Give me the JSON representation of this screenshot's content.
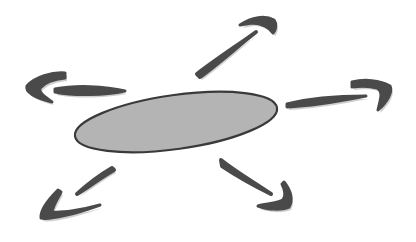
{
  "diagram": {
    "type": "hub-and-spoke",
    "colors": {
      "background": "#ffffff",
      "center_fill": "#b4b4b4",
      "center_stroke": "#3a3a3a",
      "arrow_fill": "#4a4a4a",
      "arrow_shadow": "#cfcfcf"
    },
    "center": {
      "shape": "ellipse",
      "label": ""
    },
    "arrows": [
      {
        "id": "up-right",
        "direction": "north-east"
      },
      {
        "id": "left",
        "direction": "west"
      },
      {
        "id": "right",
        "direction": "east"
      },
      {
        "id": "down-left",
        "direction": "south-west"
      },
      {
        "id": "down-right",
        "direction": "south-east"
      }
    ]
  }
}
